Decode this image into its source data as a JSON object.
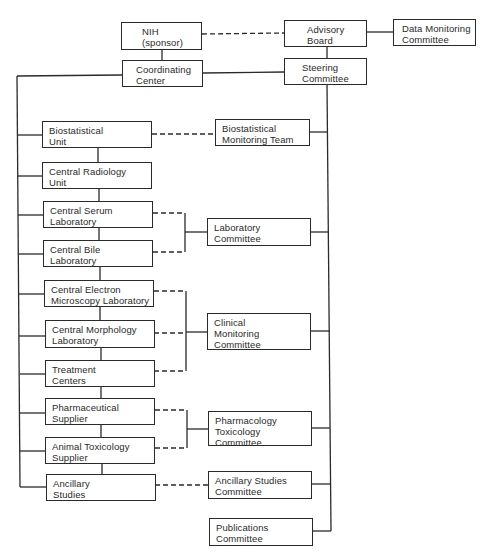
{
  "diagram": {
    "type": "organizational-chart",
    "top_nodes": {
      "nih": {
        "lines": [
          "NIH",
          "(sponsor)"
        ]
      },
      "coordinating_center": {
        "lines": [
          "Coordinating",
          "Center"
        ]
      },
      "advisory_board": {
        "lines": [
          "Advisory",
          "Board"
        ]
      },
      "data_monitoring": {
        "lines": [
          "Data Monitoring",
          "Committee"
        ]
      },
      "steering": {
        "lines": [
          "Steering",
          "Committee"
        ]
      }
    },
    "left_units": [
      {
        "id": "biostatistical-unit",
        "lines": [
          "Biostatistical",
          "Unit"
        ]
      },
      {
        "id": "central-radiology-unit",
        "lines": [
          "Central Radiology",
          "Unit"
        ]
      },
      {
        "id": "central-serum-laboratory",
        "lines": [
          "Central Serum",
          "Laboratory"
        ]
      },
      {
        "id": "central-bile-laboratory",
        "lines": [
          "Central Bile",
          "Laboratory"
        ]
      },
      {
        "id": "central-electron-microscopy-laboratory",
        "lines": [
          "Central Electron",
          "Microscopy Laboratory"
        ]
      },
      {
        "id": "central-morphology-laboratory",
        "lines": [
          "Central Morphology",
          "Laboratory"
        ]
      },
      {
        "id": "treatment-centers",
        "lines": [
          "Treatment",
          "Centers"
        ]
      },
      {
        "id": "pharmaceutical-supplier",
        "lines": [
          "Pharmaceutical",
          "Supplier"
        ]
      },
      {
        "id": "animal-toxicology-supplier",
        "lines": [
          "Animal Toxicology",
          "Supplier"
        ]
      },
      {
        "id": "ancillary-studies",
        "lines": [
          "Ancillary",
          "Studies"
        ]
      }
    ],
    "committees": [
      {
        "id": "biostatistical-monitoring-team",
        "lines": [
          "Biostatistical",
          "Monitoring Team"
        ]
      },
      {
        "id": "laboratory-committee",
        "lines": [
          "Laboratory",
          "Committee"
        ]
      },
      {
        "id": "clinical-monitoring-committee",
        "lines": [
          "Clinical",
          "Monitoring",
          "Committee"
        ]
      },
      {
        "id": "pharmacology-toxicology-committee",
        "lines": [
          "Pharmacology",
          "Toxicology",
          "Committee"
        ]
      },
      {
        "id": "ancillary-studies-committee",
        "lines": [
          "Ancillary Studies",
          "Committee"
        ]
      },
      {
        "id": "publications-committee",
        "lines": [
          "Publications",
          "Committee"
        ]
      }
    ],
    "line_color": "#2a2a2a"
  }
}
